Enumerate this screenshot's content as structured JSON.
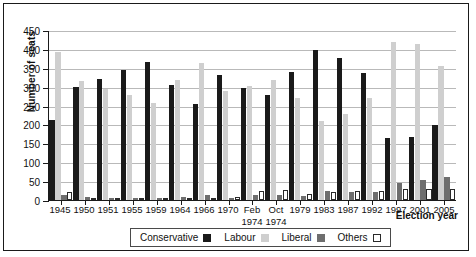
{
  "chart": {
    "type": "bar",
    "ylabel": "Number of seats",
    "xlabel": "Election year"
  },
  "legend": {
    "items": [
      {
        "label": "Conservative",
        "swatch": "conservative-swatch",
        "color": "#1a1a1a"
      },
      {
        "label": "Labour",
        "swatch": "labour-swatch",
        "color": "#cfcfcf"
      },
      {
        "label": "Liberal",
        "swatch": "liberal-swatch",
        "color": "#6e6e6e"
      },
      {
        "label": "Others",
        "swatch": "others-swatch",
        "color": "#ffffff"
      }
    ]
  },
  "yaxis": {
    "ticks": [
      "450",
      "400",
      "350",
      "300",
      "250",
      "200",
      "150",
      "100",
      "50",
      "0"
    ]
  },
  "chart_data": {
    "type": "bar",
    "title": "",
    "xlabel": "Election year",
    "ylabel": "Number of seats",
    "ylim": [
      0,
      450
    ],
    "ytick_step": 50,
    "grid": true,
    "legend_position": "bottom",
    "categories": [
      "1945",
      "1950",
      "1951",
      "1955",
      "1959",
      "1964",
      "1966",
      "1970",
      "Feb\n1974",
      "Oct\n1974",
      "1979",
      "1983",
      "1987",
      "1992",
      "1997",
      "2001",
      "2005"
    ],
    "series": [
      {
        "name": "Conservative",
        "color": "#1a1a1a",
        "values": [
          213,
          299,
          321,
          345,
          365,
          304,
          253,
          330,
          297,
          277,
          339,
          397,
          376,
          336,
          165,
          166,
          198
        ]
      },
      {
        "name": "Labour",
        "color": "#cfcfcf",
        "values": [
          393,
          315,
          295,
          277,
          258,
          317,
          364,
          288,
          301,
          319,
          269,
          209,
          229,
          271,
          418,
          412,
          355
        ]
      },
      {
        "name": "Liberal",
        "color": "#6e6e6e",
        "values": [
          12,
          9,
          6,
          6,
          6,
          9,
          12,
          6,
          14,
          13,
          11,
          23,
          22,
          20,
          46,
          52,
          62
        ]
      },
      {
        "name": "Others",
        "color": "#ffffff",
        "values": [
          22,
          3,
          3,
          2,
          1,
          0,
          2,
          7,
          23,
          26,
          16,
          21,
          23,
          24,
          30,
          28,
          30
        ]
      }
    ]
  }
}
